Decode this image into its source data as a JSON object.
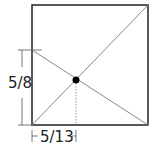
{
  "diagram": {
    "labels": {
      "vertical_dimension": "5/8",
      "horizontal_dimension": "5/13"
    },
    "colors": {
      "square": "#222222",
      "diagonals": "#888888",
      "dimension_lines": "#555555",
      "dot": "#000000"
    }
  }
}
